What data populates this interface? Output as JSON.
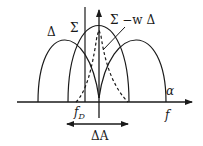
{
  "diagram": {
    "type": "monopulse-beam-patterns",
    "labels": {
      "delta": "Δ",
      "sigma": "Σ",
      "sigma_minus_w_delta": "Σ −w Δ",
      "alpha": "α",
      "f_D_base": "f",
      "f_D_sub": "D",
      "f_axis": "f",
      "delta_A": "ΔA"
    },
    "curves": [
      {
        "name": "delta-left-lobe",
        "style": "solid"
      },
      {
        "name": "delta-right-lobe",
        "style": "solid"
      },
      {
        "name": "sigma-beam",
        "style": "solid"
      },
      {
        "name": "sigma-minus-w-delta",
        "style": "dashed"
      }
    ],
    "colors": {
      "stroke": "#1a1a1a",
      "background": "#ffffff"
    }
  }
}
